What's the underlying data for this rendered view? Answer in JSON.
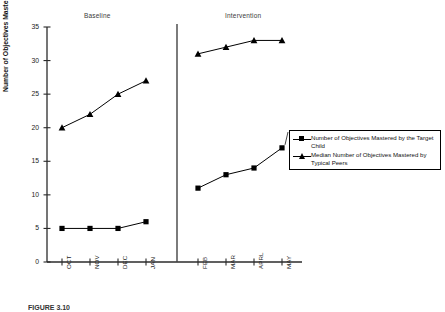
{
  "chart_data": {
    "type": "line",
    "title": "",
    "xlabel": "",
    "ylabel": "Number of Objectives Mastered",
    "ylim": [
      0,
      35
    ],
    "ytick_labels": [
      "0",
      "5",
      "10",
      "15",
      "20",
      "25",
      "30",
      "35"
    ],
    "yticks": [
      0,
      5,
      10,
      15,
      20,
      25,
      30,
      35
    ],
    "grid": false,
    "categories": [
      "OCT",
      "NOV",
      "DEC",
      "JAN",
      "FEB",
      "MAR",
      "APRL",
      "MAY"
    ],
    "phases": [
      {
        "label": "Baseline",
        "categories": [
          "OCT",
          "NOV",
          "DEC",
          "JAN"
        ]
      },
      {
        "label": "Intervention",
        "categories": [
          "FEB",
          "MAR",
          "APRL",
          "MAY"
        ]
      }
    ],
    "phase_divider": true,
    "legend_position": "right",
    "series": [
      {
        "name": "Number of Objectives Mastered by the Target Child",
        "marker": "square",
        "values": [
          5,
          5,
          5,
          6,
          11,
          13,
          14,
          17
        ]
      },
      {
        "name": "Median Number of Objectives Mastered by Typical Peers",
        "marker": "triangle",
        "values": [
          20,
          22,
          25,
          27,
          31,
          32,
          33,
          33
        ]
      }
    ]
  },
  "axes": {
    "y_label": "Number of Objectives Mastered",
    "y_ticks": [
      "0",
      "5",
      "10",
      "15",
      "20",
      "25",
      "30",
      "35"
    ],
    "x_ticks": [
      "OCT",
      "NOV",
      "DEC",
      "JAN",
      "FEB",
      "MAR",
      "APRL",
      "MAY"
    ]
  },
  "phase_labels": {
    "baseline": "Baseline",
    "intervention": "Intervention"
  },
  "legend": {
    "entries": [
      {
        "marker": "square-marker",
        "label": "Number of Objectives Mastered by the Target Child"
      },
      {
        "marker": "triangle-marker",
        "label": "Median Number of Objectives Mastered by Typical Peers"
      }
    ]
  },
  "caption": {
    "text": "FIGURE 3.10"
  },
  "colors": {
    "series": "#000000",
    "axis": "#2b2b2b",
    "background": "#ffffff"
  }
}
